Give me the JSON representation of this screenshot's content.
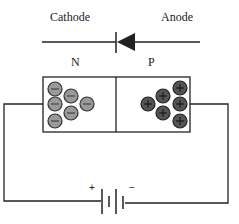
{
  "diagram": {
    "labels": {
      "cathode": "Cathode",
      "anode": "Anode",
      "n_region": "N",
      "p_region": "P",
      "battery_positive": "+",
      "battery_negative": "−"
    },
    "n_region": {
      "carrier_type": "electrons",
      "carrier_symbol": "−",
      "carrier_count": 7,
      "carrier_color": "#9a9a9a"
    },
    "p_region": {
      "carrier_type": "holes",
      "carrier_symbol": "+",
      "carrier_count": 7,
      "carrier_color": "#555555"
    },
    "colors": {
      "line": "#222222",
      "background": "#ffffff"
    }
  }
}
